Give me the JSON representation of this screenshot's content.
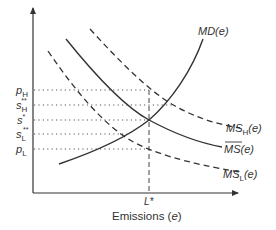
{
  "diagram": {
    "type": "economics-supply-demand",
    "x_axis_label": "Emissions (e)",
    "x_axis_label_main": "Emissions (",
    "x_axis_label_var": "e",
    "x_axis_label_close": ")",
    "x_tick_label": "L*",
    "y_tick_labels": [
      {
        "base": "p",
        "sub": "H",
        "sup": ""
      },
      {
        "base": "s",
        "sub": "H",
        "sup": "**"
      },
      {
        "base": "s",
        "sub": "",
        "sup": "*"
      },
      {
        "base": "s",
        "sub": "L",
        "sup": "**"
      },
      {
        "base": "p",
        "sub": "L",
        "sup": ""
      }
    ],
    "curves": [
      {
        "name": "MD(e)",
        "label_base": "MD",
        "label_arg": "(e)",
        "style": "solid",
        "shape": "increasing"
      },
      {
        "name": "MS_H(e)",
        "label_base": "MS",
        "label_sub": "H",
        "label_arg": "(e)",
        "style": "dashed",
        "shape": "decreasing"
      },
      {
        "name": "MS-bar(e)",
        "label_base": "MS",
        "label_sub": "",
        "label_arg": "(e)",
        "overline": true,
        "style": "solid",
        "shape": "decreasing"
      },
      {
        "name": "MS_L(e)",
        "label_base": "MS",
        "label_sub": "L",
        "label_arg": "(e)",
        "style": "dashed",
        "shape": "decreasing"
      }
    ],
    "colors": {
      "line": "#333333",
      "text": "#333333",
      "guide": "#555555"
    }
  }
}
